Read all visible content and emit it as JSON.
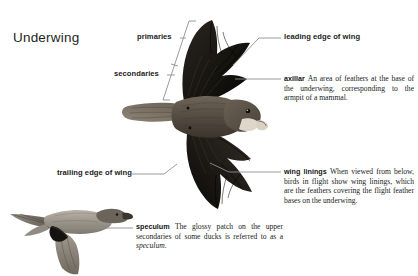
{
  "page": {
    "title": "Underwing",
    "background": "#ffffff",
    "ink": "#201d1d",
    "leader_color": "#8e8e8e"
  },
  "labels": {
    "primaries": "primaries",
    "secondaries": "secondaries",
    "trailing_edge": "trailing edge of wing",
    "leading_edge": "leading edge of wing"
  },
  "glossary": {
    "axillar": {
      "term": "axillar",
      "definition": "An area of feathers at the base of the underwing, corresponding to the armpit of a mammal."
    },
    "wing_linings": {
      "term": "wing linings",
      "definition": "When viewed from below, birds in flight show wing linings, which are the feathers covering the flight feather bases on the underwing."
    },
    "speculum": {
      "term": "speculum",
      "definition_before": "The glossy patch on the upper secondaries of some ducks is referred to as a ",
      "definition_italic": "speculum",
      "definition_after": "."
    }
  },
  "illustrations": {
    "hawk": "raptor-underwing-illustration",
    "duck": "pintail-duck-flight-illustration"
  }
}
